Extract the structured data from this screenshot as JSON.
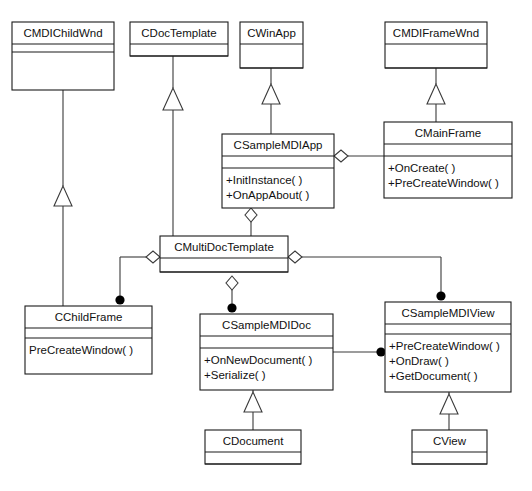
{
  "diagram": {
    "type": "uml-class-diagram",
    "background_color": "#ffffff",
    "line_color": "#3a3a3a",
    "text_color": "#111111"
  },
  "classes": [
    {
      "id": "cmdichildwnd",
      "name": "CMDIChildWnd",
      "methods": [],
      "x": 12,
      "y": 22,
      "w": 102,
      "h": 68,
      "name_h": 22,
      "empty_h": 8
    },
    {
      "id": "cdoctemplate",
      "name": "CDocTemplate",
      "methods": [],
      "x": 130,
      "y": 22,
      "w": 98,
      "h": 34,
      "name_h": 22,
      "empty_h": 12
    },
    {
      "id": "cwinapp",
      "name": "CWinApp",
      "methods": [],
      "x": 240,
      "y": 22,
      "w": 63,
      "h": 46,
      "name_h": 22,
      "empty_h": 24
    },
    {
      "id": "cmdiframewnd",
      "name": "CMDIFrameWnd",
      "methods": [],
      "x": 385,
      "y": 22,
      "w": 102,
      "h": 46,
      "name_h": 22,
      "empty_h": 24
    },
    {
      "id": "csamplemdiapp",
      "name": "CSampleMDIApp",
      "methods": [
        "+InitInstance( )",
        "+OnAppAbout( )"
      ],
      "x": 222,
      "y": 134,
      "w": 112,
      "h": 74,
      "name_h": 22,
      "empty_h": 12
    },
    {
      "id": "cmainframe",
      "name": "CMainFrame",
      "methods": [
        "+OnCreate( )",
        "+PreCreateWindow( )"
      ],
      "x": 384,
      "y": 122,
      "w": 128,
      "h": 76,
      "name_h": 22,
      "empty_h": 12
    },
    {
      "id": "cmultidoctemplate",
      "name": "CMultiDocTemplate",
      "methods": [],
      "x": 160,
      "y": 236,
      "w": 128,
      "h": 36,
      "name_h": 22,
      "empty_h": 14
    },
    {
      "id": "cchildframe",
      "name": "CChildFrame",
      "methods": [
        "PreCreateWindow( )"
      ],
      "x": 25,
      "y": 306,
      "w": 127,
      "h": 68,
      "name_h": 22,
      "empty_h": 10
    },
    {
      "id": "csamplemdidoc",
      "name": "CSampleMDIDoc",
      "methods": [
        "+OnNewDocument( )",
        "+Serialize( )"
      ],
      "x": 200,
      "y": 314,
      "w": 133,
      "h": 76,
      "name_h": 22,
      "empty_h": 12
    },
    {
      "id": "csamplemdiview",
      "name": "CSampleMDIView",
      "methods": [
        "+PreCreateWindow( )",
        "+OnDraw( )",
        "+GetDocument( )"
      ],
      "x": 385,
      "y": 302,
      "w": 126,
      "h": 90,
      "name_h": 22,
      "empty_h": 10
    },
    {
      "id": "cdocument",
      "name": "CDocument",
      "methods": [],
      "x": 205,
      "y": 430,
      "w": 96,
      "h": 34,
      "name_h": 22,
      "empty_h": 12
    },
    {
      "id": "cview",
      "name": "CView",
      "methods": [],
      "x": 412,
      "y": 430,
      "w": 75,
      "h": 34,
      "name_h": 22,
      "empty_h": 12
    }
  ],
  "relationships": [
    {
      "kind": "generalization",
      "from": "cchildframe",
      "to": "cmdichildwnd",
      "label": ""
    },
    {
      "kind": "generalization",
      "from": "cmultidoctemplate",
      "to": "cdoctemplate",
      "label": ""
    },
    {
      "kind": "generalization",
      "from": "csamplemdiapp",
      "to": "cwinapp",
      "label": ""
    },
    {
      "kind": "generalization",
      "from": "cmainframe",
      "to": "cmdiframewnd",
      "label": ""
    },
    {
      "kind": "generalization",
      "from": "cdocument_up",
      "to": "csamplemdidoc",
      "label": ""
    },
    {
      "kind": "generalization",
      "from": "cview_up",
      "to": "csamplemdiview",
      "label": ""
    },
    {
      "kind": "aggregation",
      "from": "csamplemdiapp",
      "to": "cmainframe",
      "label": ""
    },
    {
      "kind": "aggregation",
      "from": "csamplemdiapp",
      "to": "cmultidoctemplate",
      "label": ""
    },
    {
      "kind": "aggregation",
      "from": "cmultidoctemplate",
      "to": "cchildframe",
      "label": ""
    },
    {
      "kind": "aggregation",
      "from": "cmultidoctemplate",
      "to": "csamplemdidoc",
      "label": ""
    },
    {
      "kind": "aggregation",
      "from": "cmultidoctemplate",
      "to": "csamplemdiview",
      "label": ""
    },
    {
      "kind": "association",
      "from": "csamplemdidoc",
      "to": "csamplemdiview",
      "label": ""
    }
  ]
}
